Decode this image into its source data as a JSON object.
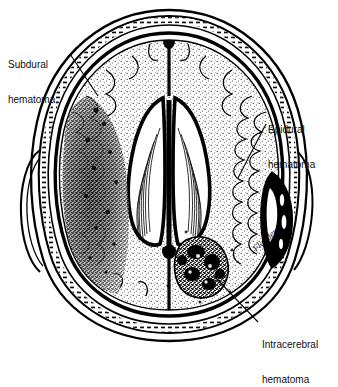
{
  "figure": {
    "kind": "medical-illustration",
    "view": "axial cross-section of the head",
    "background_color": "#ffffff",
    "ink_color": "#000000",
    "border_color": "#bdbdbd",
    "signature": "Flanders"
  },
  "labels": {
    "subdural": {
      "line1": "Subdural",
      "line2": "hematoma",
      "points_to": "crescent-shaped collection along the left convexity, inside the skull and outside the brain"
    },
    "epidural": {
      "line1": "Epidural",
      "line2": "hematoma",
      "points_to": "biconvex lens-shaped collection between skull and dura on the right side"
    },
    "intracerebral": {
      "line1": "Intracerebral",
      "line2": "hematoma",
      "points_to": "dense blob within the right posterior brain parenchyma"
    }
  },
  "structures": {
    "scalp": "scalp",
    "skull": "skull",
    "dura": "dura mater",
    "cortex": "cerebral cortex with gyri and sulci",
    "ventricles": "lateral ventricles",
    "falx": "falx cerebri",
    "choroid_plexus": "choroid plexus"
  }
}
